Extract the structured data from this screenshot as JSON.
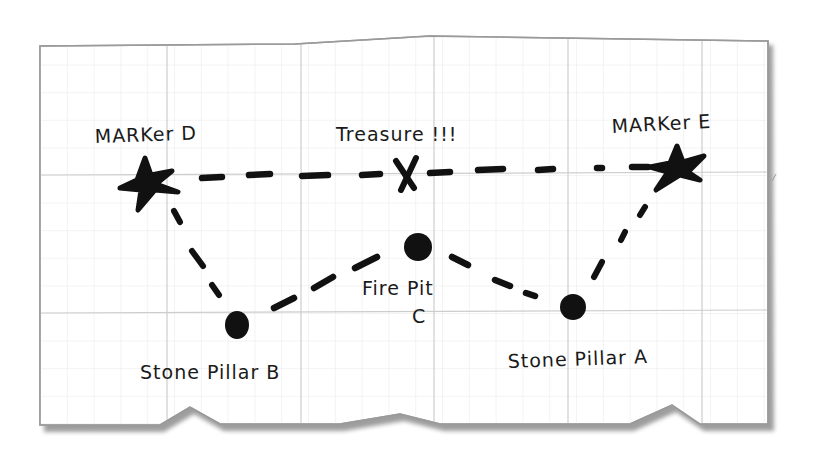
{
  "map": {
    "title": "Treasure map sketch on grid paper",
    "colors": {
      "background": "#ffffff",
      "paper": "#ffffff",
      "paper_border": "#9a9a9a",
      "paper_shadow": "#8f8f8f",
      "grid_minor": "#e6e6e6",
      "grid_major": "#cfcfcf",
      "ink": "#111111"
    },
    "landmarks": [
      {
        "id": "marker-d",
        "label": "MARKer D",
        "symbol": "star-icon",
        "x": 145,
        "y": 182
      },
      {
        "id": "treasure",
        "label": "Treasure !!!",
        "symbol": "x-mark-icon",
        "x": 405,
        "y": 175
      },
      {
        "id": "marker-e",
        "label": "MARKer E",
        "symbol": "star-icon",
        "x": 676,
        "y": 165
      },
      {
        "id": "fire-pit-c",
        "label": "Fire Pit",
        "sublabel": "C",
        "symbol": "dot-icon",
        "x": 418,
        "y": 247
      },
      {
        "id": "stone-pillar-b",
        "label": "Stone Pillar B",
        "symbol": "dot-icon",
        "x": 237,
        "y": 325
      },
      {
        "id": "stone-pillar-a",
        "label": "Stone Pillar A",
        "symbol": "dot-icon",
        "x": 573,
        "y": 307
      }
    ],
    "paths": [
      {
        "from": "marker-d",
        "to": "treasure",
        "style": "dashed"
      },
      {
        "from": "treasure",
        "to": "marker-e",
        "style": "dashed"
      },
      {
        "from": "marker-d",
        "to": "stone-pillar-b",
        "style": "dashed"
      },
      {
        "from": "stone-pillar-b",
        "to": "fire-pit-c",
        "style": "dashed"
      },
      {
        "from": "fire-pit-c",
        "to": "stone-pillar-a",
        "style": "dashed"
      },
      {
        "from": "stone-pillar-a",
        "to": "marker-e",
        "style": "dashed"
      }
    ]
  },
  "labels": {
    "marker_d": "MARKer D",
    "treasure": "Treasure !!!",
    "marker_e": "MARKer E",
    "fire_pit": "Fire Pit",
    "fire_pit_letter": "C",
    "stone_pillar_b": "Stone Pillar B",
    "stone_pillar_a": "Stone Pillar A"
  }
}
